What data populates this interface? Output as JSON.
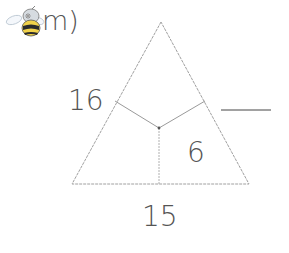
{
  "question": {
    "label": "m)",
    "icon": "bee-icon"
  },
  "triangle": {
    "regions": {
      "left_top": "16",
      "bottom_right": "6",
      "bottom": "15",
      "answer_blank": ""
    }
  },
  "colors": {
    "line": "#9a9a9a",
    "text": "#555555",
    "blank_line": "#444444"
  }
}
